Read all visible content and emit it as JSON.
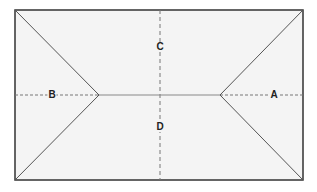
{
  "diagram": {
    "type": "hip-roof-plan",
    "colors": {
      "fill": "#f4f4f4",
      "outline": "#333333",
      "hip_lines": "#555555",
      "ridge": "#888888",
      "dashed_axes": "#777777",
      "label": "#222222"
    },
    "outline": {
      "x1": 15,
      "y1": 10,
      "x2": 303,
      "y2": 180
    },
    "ridge": {
      "x1": 99,
      "y1": 95,
      "x2": 220,
      "y2": 95
    },
    "labels": [
      {
        "id": "A",
        "text": "A",
        "x": 274,
        "y": 95
      },
      {
        "id": "B",
        "text": "B",
        "x": 52,
        "y": 95
      },
      {
        "id": "C",
        "text": "C",
        "x": 160,
        "y": 47
      },
      {
        "id": "D",
        "text": "D",
        "x": 160,
        "y": 127
      }
    ]
  }
}
